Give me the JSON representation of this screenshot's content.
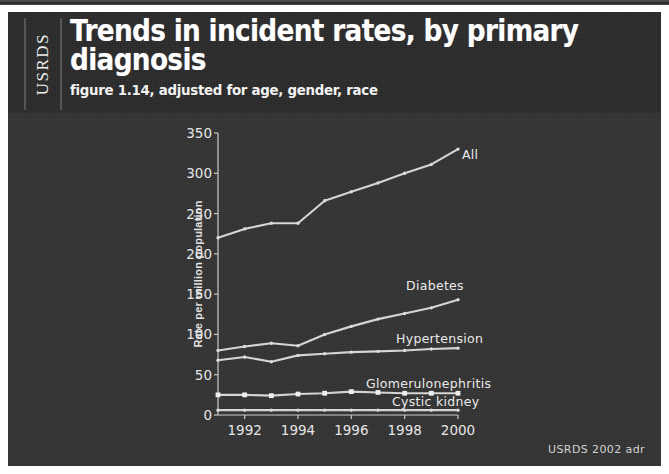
{
  "header": {
    "org_tab": "USRDS",
    "title": "Trends in incident rates, by primary diagnosis",
    "subtitle": "figure 1.14, adjusted for age, gender, race"
  },
  "footer": {
    "credit": "USRDS 2002 adr"
  },
  "colors": {
    "header_background": "#2b2b2b",
    "panel_background": "#343434",
    "line": "#e8e8e8",
    "text": "#f0f0f0",
    "page_background": "#ffffff"
  },
  "chart_data": {
    "type": "line",
    "title": "Trends in incident rates, by primary diagnosis",
    "subtitle": "figure 1.14, adjusted for age, gender, race",
    "xlabel": "",
    "ylabel": "Rate per million population",
    "x": [
      1991,
      1992,
      1993,
      1994,
      1995,
      1996,
      1997,
      1998,
      1999,
      2000
    ],
    "xticks": [
      1992,
      1994,
      1996,
      1998,
      2000
    ],
    "xlim": [
      1991,
      2000
    ],
    "yticks": [
      0,
      50,
      100,
      150,
      200,
      250,
      300,
      350
    ],
    "ylim": [
      0,
      350
    ],
    "grid": false,
    "legend": "inline-labels",
    "series": [
      {
        "name": "All",
        "label": "All",
        "marker": "dot",
        "values": [
          220,
          231,
          238,
          238,
          266,
          277,
          288,
          300,
          311,
          330
        ]
      },
      {
        "name": "Diabetes",
        "label": "Diabetes",
        "marker": "dot",
        "values": [
          80,
          85,
          89,
          86,
          100,
          110,
          119,
          126,
          133,
          143
        ]
      },
      {
        "name": "Hypertension",
        "label": "Hypertension",
        "marker": "dot",
        "values": [
          68,
          72,
          66,
          74,
          76,
          78,
          79,
          80,
          82,
          83
        ]
      },
      {
        "name": "Glomerulonephritis",
        "label": "Glomerulonephritis",
        "marker": "square",
        "values": [
          25,
          25,
          24,
          26,
          27,
          29,
          28,
          27,
          27,
          27
        ]
      },
      {
        "name": "Cystic kidney",
        "label": "Cystic kidney",
        "marker": "dot",
        "values": [
          6,
          6,
          6,
          6,
          6,
          6,
          6,
          6,
          6,
          6
        ]
      }
    ]
  }
}
